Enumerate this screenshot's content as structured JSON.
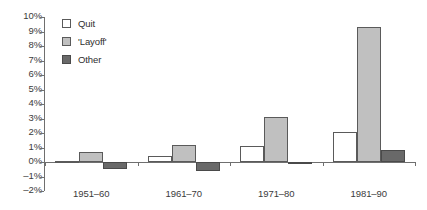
{
  "chart_data": {
    "type": "bar",
    "title": "",
    "subtitle": "",
    "xlabel": "",
    "ylabel": "",
    "categories": [
      "1951–60",
      "1961–70",
      "1971–80",
      "1981–90"
    ],
    "series": [
      {
        "name": "Quit",
        "color": "#ffffff",
        "values": [
          0.1,
          0.4,
          1.1,
          2.1
        ]
      },
      {
        "name": "'Layoff'",
        "color": "#c0c0c0",
        "values": [
          0.7,
          1.2,
          3.1,
          9.3
        ]
      },
      {
        "name": "Other",
        "color": "#696969",
        "values": [
          -0.5,
          -0.6,
          -0.15,
          0.8
        ]
      }
    ],
    "ylim": [
      -2,
      10
    ],
    "ytick_values": [
      10,
      9,
      8,
      7,
      6,
      5,
      4,
      3,
      2,
      1,
      0,
      -1,
      -2
    ],
    "ytick_labels": [
      "10%",
      "9%",
      "8%",
      "7%",
      "6%",
      "5%",
      "4%",
      "3%",
      "2%",
      "1%",
      "0%",
      "–1%",
      "–2%"
    ],
    "grid": false,
    "legend_position": "upper-left-inside",
    "value_format": "percent"
  },
  "legend": {
    "items": [
      {
        "label": "Quit",
        "swatch": "quit"
      },
      {
        "label": "'Layoff'",
        "swatch": "layoff"
      },
      {
        "label": "Other",
        "swatch": "other"
      }
    ]
  },
  "colors": {
    "quit": "#ffffff",
    "layoff": "#c0c0c0",
    "other": "#696969",
    "axis": "#6f6f6f",
    "text": "#3b3b3b"
  }
}
